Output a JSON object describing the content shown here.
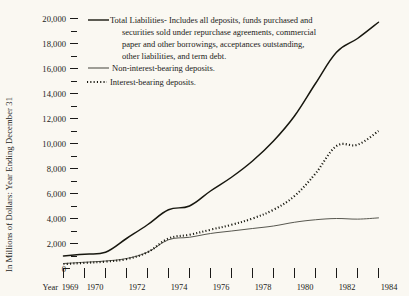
{
  "chart_data": {
    "type": "line",
    "title": "",
    "xlabel": "Year",
    "ylabel": "In Millions of Dollars: Year Ending December 31",
    "xlim": [
      1969,
      1984
    ],
    "ylim": [
      0,
      20000
    ],
    "grid": false,
    "legend_position": "top-center",
    "y_tick_step": 2000,
    "y_minor_tick_step": 1000,
    "x": [
      1969,
      1970,
      1971,
      1972,
      1973,
      1974,
      1975,
      1976,
      1977,
      1978,
      1979,
      1980,
      1981,
      1982,
      1983,
      1984
    ],
    "ytick_labels": [
      "0",
      "2,000",
      "4,000",
      "6,000",
      "8,000",
      "10,000",
      "12,000",
      "14,000",
      "16,000",
      "18,000",
      "20,000"
    ],
    "ytick_values": [
      0,
      2000,
      4000,
      6000,
      8000,
      10000,
      12000,
      14000,
      16000,
      18000,
      20000
    ],
    "xtick_labels": [
      "1969",
      "1970",
      "",
      "1972",
      "",
      "1974",
      "",
      "1976",
      "",
      "1978",
      "",
      "1980",
      "",
      "1982",
      "",
      "1984"
    ],
    "series": [
      {
        "name": "Total Liabilities",
        "style": "solid-thick",
        "legend_label": "Total Liabilities- Includes all deposits, funds purchased and securities sold under repurchase agreements, commercial paper and other borrowings, acceptances outstanding, other liabilities, and term debt.",
        "values": [
          1000,
          1150,
          1300,
          2400,
          3500,
          4700,
          5000,
          6200,
          7300,
          8600,
          10200,
          12200,
          14800,
          17300,
          18400,
          19700
        ]
      },
      {
        "name": "Non-interest-bearing deposits",
        "style": "solid-thin",
        "legend_label": "Non-interest-bearing deposits.",
        "values": [
          400,
          500,
          600,
          800,
          1300,
          2300,
          2500,
          2800,
          3000,
          3200,
          3400,
          3700,
          3900,
          4000,
          3950,
          4050
        ]
      },
      {
        "name": "Interest-bearing deposits",
        "style": "dotted",
        "legend_label": "Interest-bearing deposits.",
        "values": [
          350,
          450,
          550,
          750,
          1300,
          2400,
          2700,
          3100,
          3500,
          4000,
          4700,
          5800,
          7600,
          9800,
          9900,
          11000
        ]
      }
    ]
  },
  "legend": {
    "entries": [
      {
        "swatch": "solid-thick",
        "lines": [
          "Total Liabilities- Includes all deposits, funds purchased and",
          "securities sold under repurchase agreements, commercial",
          "paper and other borrowings, acceptances outstanding,",
          "other liabilities, and term debt."
        ]
      },
      {
        "swatch": "solid-thin",
        "lines": [
          "Non-interest-bearing deposits."
        ]
      },
      {
        "swatch": "dotted",
        "lines": [
          "Interest-bearing deposits."
        ]
      }
    ],
    "line_total_1": "Total Liabilities- Includes all deposits, funds purchased and",
    "line_total_2": "securities sold under repurchase agreements, commercial",
    "line_total_3": "paper and other borrowings, acceptances outstanding,",
    "line_total_4": "other liabilities, and term debt.",
    "line_noninterest": "Non-interest-bearing deposits.",
    "line_interest": "Interest-bearing deposits."
  },
  "axes": {
    "y_title": "In Millions of Dollars: Year Ending December 31",
    "x_title": "Year",
    "y_labels": {
      "v20000": "20,000",
      "v18000": "18,000",
      "v16000": "16,000",
      "v14000": "14,000",
      "v12000": "12,000",
      "v10000": "10,000",
      "v8000": "8,000",
      "v6000": "6,000",
      "v4000": "4,000",
      "v2000": "2,000",
      "v0": "0"
    },
    "x_labels": {
      "y1969": "1969",
      "y1970": "1970",
      "y1972": "1972",
      "y1974": "1974",
      "y1976": "1976",
      "y1978": "1978",
      "y1980": "1980",
      "y1982": "1982",
      "y1984": "1984"
    }
  },
  "colors": {
    "background": "#faf8f2",
    "ink": "#1a1a18",
    "series_total": "#17170f",
    "series_noninterest": "#3a3a32",
    "series_interest": "#17170f"
  }
}
